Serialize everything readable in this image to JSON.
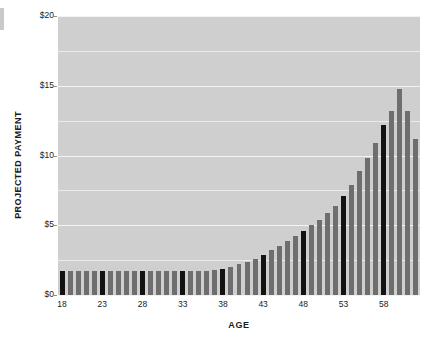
{
  "chart_data": {
    "type": "bar",
    "title": "",
    "xlabel": "AGE",
    "ylabel": "PROJECTED PAYMENT",
    "ylim": [
      0,
      20
    ],
    "ytick_values": [
      0,
      2.5,
      5,
      7.5,
      10,
      12.5,
      15,
      17.5,
      20
    ],
    "ytick_labels": [
      "$0",
      "",
      "$5",
      "",
      "$10",
      "",
      "$15",
      "",
      "$20"
    ],
    "ytick_major": [
      0,
      5,
      10,
      15,
      20
    ],
    "xtick_labels": [
      "18",
      "23",
      "28",
      "33",
      "38",
      "43",
      "48",
      "53",
      "58"
    ],
    "grid": true,
    "legend": "none",
    "plot_background": "#cfcfcf",
    "bar_color": "#6e6e6e",
    "highlight_color": "#121212",
    "highlight_categories": [
      "18",
      "23",
      "28",
      "33",
      "38",
      "43",
      "48",
      "53",
      "58"
    ],
    "categories": [
      "18",
      "19",
      "20",
      "21",
      "22",
      "23",
      "24",
      "25",
      "26",
      "27",
      "28",
      "29",
      "30",
      "31",
      "32",
      "33",
      "34",
      "35",
      "36",
      "37",
      "38",
      "39",
      "40",
      "41",
      "42",
      "43",
      "44",
      "45",
      "46",
      "47",
      "48",
      "49",
      "50",
      "51",
      "52",
      "53",
      "54",
      "55",
      "56",
      "57",
      "58",
      "59",
      "60",
      "61",
      "62"
    ],
    "values": [
      1.7,
      1.7,
      1.7,
      1.7,
      1.7,
      1.7,
      1.7,
      1.7,
      1.7,
      1.7,
      1.7,
      1.7,
      1.7,
      1.7,
      1.7,
      1.7,
      1.7,
      1.7,
      1.75,
      1.8,
      1.9,
      2.0,
      2.2,
      2.4,
      2.6,
      2.9,
      3.2,
      3.5,
      3.9,
      4.2,
      4.6,
      5.0,
      5.4,
      5.9,
      6.4,
      7.1,
      7.9,
      8.9,
      9.8,
      10.9,
      12.2,
      13.2,
      14.8,
      13.2,
      11.2
    ]
  }
}
